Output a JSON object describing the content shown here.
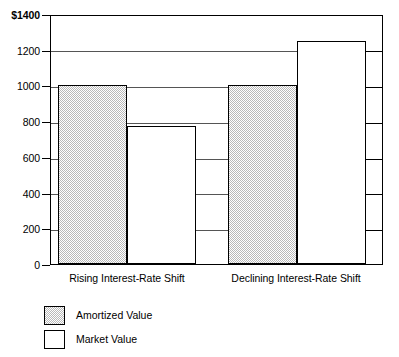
{
  "chart_data": {
    "type": "bar",
    "title": "",
    "subtitle": "",
    "xlabel": "",
    "ylabel": "",
    "categories": [
      "Rising Interest-Rate Shift",
      "Declining Interest-Rate Shift"
    ],
    "series": [
      {
        "name": "Amortized Value",
        "values": [
          1000,
          1000
        ],
        "fill": "gray-dither"
      },
      {
        "name": "Market Value",
        "values": [
          775,
          1250
        ],
        "fill": "white"
      }
    ],
    "ylim": [
      0,
      1400
    ],
    "ytick_values": [
      0,
      200,
      400,
      600,
      800,
      1000,
      1200,
      1400
    ],
    "ytick_labels": [
      "0",
      "200",
      "400",
      "600",
      "800",
      "1000",
      "1200",
      "$1400"
    ],
    "grid": true,
    "grid_axis": "y",
    "legend_position": "below-left",
    "axis_color": "#000000",
    "grid_color": "#555555",
    "bar_edge_color": "#000000",
    "amortized_fill_color": "#b9b9b9",
    "market_fill_color": "#ffffff",
    "background_color": "#ffffff"
  },
  "legend": {
    "items": [
      {
        "label": "Amortized Value",
        "swatch": "gray-dither-swatch"
      },
      {
        "label": "Market Value",
        "swatch": "white-swatch"
      }
    ]
  }
}
